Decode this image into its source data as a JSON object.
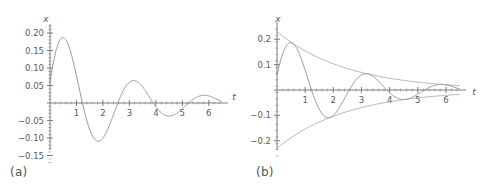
{
  "figure": {
    "background_color": "#ffffff",
    "curve_color": "#8a8a8a",
    "axis_color": "#6e6e6e",
    "text_color": "#5a5a5a",
    "panels": [
      {
        "id": "a",
        "caption": "(a)",
        "xlabel": "t",
        "ylabel": "x",
        "x_ticks": [
          "1",
          "2",
          "3",
          "4",
          "5",
          "6"
        ],
        "y_ticks": [
          "0.20",
          "0.15",
          "0.10",
          "0.05",
          "-0.05",
          "-0.10",
          "-0.15"
        ]
      },
      {
        "id": "b",
        "caption": "(b)",
        "xlabel": "t",
        "ylabel": "x",
        "x_ticks": [
          "1",
          "2",
          "3",
          "4",
          "5",
          "6"
        ],
        "y_ticks": [
          "0.2",
          "0.1",
          "-0.1",
          "-0.2"
        ]
      }
    ]
  },
  "chart_data": [
    {
      "type": "line",
      "id": "a",
      "title": "",
      "xlabel": "t",
      "ylabel": "x",
      "xlim": [
        0,
        6.5
      ],
      "ylim": [
        -0.17,
        0.22
      ],
      "grid": false,
      "legend": "none",
      "x_tick_values": [
        1,
        2,
        3,
        4,
        5,
        6
      ],
      "x_tick_labels": [
        "1",
        "2",
        "3",
        "4",
        "5",
        "6"
      ],
      "y_tick_values": [
        0.2,
        0.15,
        0.1,
        0.05,
        -0.05,
        -0.1,
        -0.15
      ],
      "y_tick_labels": [
        "0.20",
        "0.15",
        "0.10",
        "0.05",
        "-0.05",
        "-0.10",
        "-0.15"
      ],
      "series": [
        {
          "name": "damped oscillation",
          "color": "#8a8a8a",
          "model": "x(t) = 0.23 * exp(-0.40 t) * sin(2.35 t + 0.26)",
          "amplitude0": 0.23,
          "decay_rate": 0.4,
          "angular_frequency": 2.35,
          "phase": 0.26,
          "x": [
            0.0,
            0.1,
            0.2,
            0.3,
            0.4,
            0.45,
            0.5,
            0.6,
            0.7,
            0.8,
            0.9,
            1.0,
            1.1,
            1.2,
            1.3,
            1.4,
            1.5,
            1.6,
            1.7,
            1.8,
            1.9,
            2.0,
            2.1,
            2.2,
            2.3,
            2.4,
            2.5,
            2.6,
            2.7,
            2.8,
            2.9,
            3.0,
            3.2,
            3.4,
            3.5,
            3.6,
            3.8,
            4.0,
            4.2,
            4.4,
            4.6,
            4.8,
            5.0,
            5.1,
            5.3,
            5.5,
            5.7,
            5.9,
            6.1,
            6.3,
            6.5
          ],
          "y": [
            0.058,
            0.114,
            0.161,
            0.191,
            0.204,
            0.205,
            0.2,
            0.176,
            0.135,
            0.083,
            0.027,
            -0.03,
            -0.08,
            -0.119,
            -0.137,
            -0.138,
            -0.123,
            -0.094,
            -0.055,
            -0.013,
            0.029,
            0.063,
            0.087,
            0.096,
            0.092,
            0.076,
            0.05,
            0.019,
            -0.013,
            -0.041,
            -0.06,
            -0.069,
            -0.059,
            -0.022,
            0.0,
            0.022,
            0.044,
            0.042,
            0.022,
            -0.006,
            -0.027,
            -0.032,
            -0.021,
            -0.012,
            0.008,
            0.02,
            0.021,
            0.011,
            -0.003,
            -0.013,
            -0.015
          ]
        }
      ]
    },
    {
      "type": "line",
      "id": "b",
      "title": "",
      "xlabel": "t",
      "ylabel": "x",
      "xlim": [
        0,
        6.5
      ],
      "ylim": [
        -0.26,
        0.26
      ],
      "grid": false,
      "legend": "none",
      "x_tick_values": [
        1,
        2,
        3,
        4,
        5,
        6
      ],
      "x_tick_labels": [
        "1",
        "2",
        "3",
        "4",
        "5",
        "6"
      ],
      "y_tick_values": [
        0.2,
        0.1,
        -0.1,
        -0.2
      ],
      "y_tick_labels": [
        "0.2",
        "0.1",
        "-0.1",
        "-0.2"
      ],
      "series": [
        {
          "name": "damped oscillation",
          "color": "#8a8a8a",
          "model": "x(t) = 0.23 * exp(-0.40 t) * sin(2.35 t + 0.26)",
          "amplitude0": 0.23,
          "decay_rate": 0.4,
          "angular_frequency": 2.35,
          "phase": 0.26,
          "x": [
            0.0,
            0.1,
            0.2,
            0.3,
            0.4,
            0.45,
            0.5,
            0.6,
            0.7,
            0.8,
            0.9,
            1.0,
            1.1,
            1.2,
            1.3,
            1.4,
            1.5,
            1.6,
            1.7,
            1.8,
            1.9,
            2.0,
            2.1,
            2.2,
            2.3,
            2.4,
            2.5,
            2.6,
            2.7,
            2.8,
            2.9,
            3.0,
            3.2,
            3.4,
            3.5,
            3.6,
            3.8,
            4.0,
            4.2,
            4.4,
            4.6,
            4.8,
            5.0,
            5.1,
            5.3,
            5.5,
            5.7,
            5.9,
            6.1,
            6.3,
            6.5
          ],
          "y": [
            0.058,
            0.114,
            0.161,
            0.191,
            0.204,
            0.205,
            0.2,
            0.176,
            0.135,
            0.083,
            0.027,
            -0.03,
            -0.08,
            -0.119,
            -0.137,
            -0.138,
            -0.123,
            -0.094,
            -0.055,
            -0.013,
            0.029,
            0.063,
            0.087,
            0.096,
            0.092,
            0.076,
            0.05,
            0.019,
            -0.013,
            -0.041,
            -0.06,
            -0.069,
            -0.059,
            -0.022,
            0.0,
            0.022,
            0.044,
            0.042,
            0.022,
            -0.006,
            -0.027,
            -0.032,
            -0.021,
            -0.012,
            0.008,
            0.02,
            0.021,
            0.011,
            -0.003,
            -0.013,
            -0.015
          ]
        },
        {
          "name": "upper envelope",
          "color": "#9a9a9a",
          "model": "x(t) = +0.23 * exp(-0.40 t)",
          "x": [
            0.0,
            0.5,
            1.0,
            1.5,
            2.0,
            2.5,
            3.0,
            3.5,
            4.0,
            4.5,
            5.0,
            5.5,
            6.0,
            6.5
          ],
          "y": [
            0.23,
            0.188,
            0.154,
            0.126,
            0.103,
            0.085,
            0.069,
            0.057,
            0.046,
            0.038,
            0.031,
            0.025,
            0.021,
            0.017
          ]
        },
        {
          "name": "lower envelope",
          "color": "#9a9a9a",
          "model": "x(t) = -0.23 * exp(-0.40 t)",
          "x": [
            0.0,
            0.5,
            1.0,
            1.5,
            2.0,
            2.5,
            3.0,
            3.5,
            4.0,
            4.5,
            5.0,
            5.5,
            6.0,
            6.5
          ],
          "y": [
            -0.23,
            -0.188,
            -0.154,
            -0.126,
            -0.103,
            -0.085,
            -0.069,
            -0.057,
            -0.046,
            -0.038,
            -0.031,
            -0.025,
            -0.021,
            -0.017
          ]
        }
      ]
    }
  ]
}
